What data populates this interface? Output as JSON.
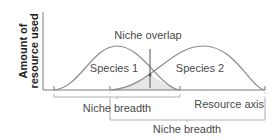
{
  "diagram": {
    "y_axis_label_line1": "Amount of",
    "y_axis_label_line2": "resource used",
    "x_axis_label": "Resource axis",
    "overlap_label": "Niche overlap",
    "species": [
      {
        "name": "Species 1",
        "niche_breadth_label": "Niche breadth"
      },
      {
        "name": "Species 2",
        "niche_breadth_label": "Niche breadth"
      }
    ],
    "colors": {
      "axis": "#7a7a7a",
      "curve": "#8a8a8a",
      "overlap_fill": "#e6e6e6",
      "text": "#4a4a4a",
      "bracket": "#b0b0b0"
    }
  }
}
